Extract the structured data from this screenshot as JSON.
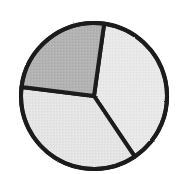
{
  "figure": {
    "kind": "pie-chart",
    "background_color": "#ffffff",
    "outline_color": "#1a1a1a",
    "outline_width_px": 4,
    "center_x": 94,
    "center_y": 96,
    "radius_px": 73,
    "title": "",
    "subtitle": "",
    "caption": ""
  },
  "chart_data": {
    "type": "pie",
    "title": "",
    "xlabel": "",
    "ylabel": "",
    "grid": false,
    "legend": false,
    "legend_position": "none",
    "total": 100,
    "units": "percent",
    "start_angle_deg": -82,
    "direction": "clockwise",
    "categories": [
      "Slice 1",
      "Slice 2",
      "Slice 3"
    ],
    "values": [
      38,
      34,
      28
    ],
    "labels_shown": false,
    "slices": [
      {
        "name": "Slice 1",
        "value": 38,
        "color": "#e8e8e8",
        "edge_color": "#1a1a1a",
        "start_angle_deg": -82,
        "end_angle_deg": 56,
        "position": "right",
        "shade": "light-gray"
      },
      {
        "name": "Slice 2",
        "value": 34,
        "color": "#e4e4e4",
        "edge_color": "#1a1a1a",
        "start_angle_deg": 56,
        "end_angle_deg": 187,
        "position": "bottom-left",
        "shade": "light-gray"
      },
      {
        "name": "Slice 3",
        "value": 28,
        "color": "#b3b3b3",
        "edge_color": "#1a1a1a",
        "start_angle_deg": 187,
        "end_angle_deg": 278,
        "position": "top-left",
        "shade": "medium-gray"
      }
    ]
  }
}
